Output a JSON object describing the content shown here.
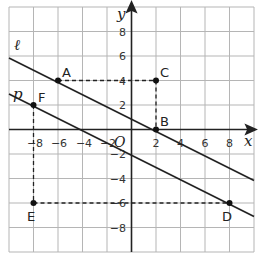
{
  "graph": {
    "x_axis_label": "x",
    "y_axis_label": "y",
    "origin_label": "O",
    "x_range": [
      -10,
      10
    ],
    "y_range": [
      -10,
      10
    ],
    "grid_step": 2,
    "x_ticks": [
      "−8",
      "−6",
      "−4",
      "−2",
      "2",
      "4",
      "6",
      "8"
    ],
    "y_ticks": [
      "8",
      "6",
      "4",
      "2",
      "−2",
      "−4",
      "−6",
      "−8"
    ],
    "lines": [
      {
        "name": "ℓ",
        "label": "ℓ",
        "equation": "y = -x/2 + 1",
        "through": [
          "A",
          "B"
        ]
      },
      {
        "name": "p",
        "label": "p",
        "equation": "y = -x/2 - 2",
        "through": [
          "F",
          "D"
        ]
      }
    ],
    "points": [
      {
        "label": "A",
        "x": -6,
        "y": 4
      },
      {
        "label": "B",
        "x": 2,
        "y": 0
      },
      {
        "label": "C",
        "x": 2,
        "y": 4
      },
      {
        "label": "D",
        "x": 8,
        "y": -6
      },
      {
        "label": "E",
        "x": -8,
        "y": -6
      },
      {
        "label": "F",
        "x": -8,
        "y": 2
      }
    ],
    "dashed_segments": [
      {
        "from": "A",
        "to": "C"
      },
      {
        "from": "C",
        "to": "B"
      },
      {
        "from": "F",
        "to": "E"
      },
      {
        "from": "E",
        "to": "D"
      }
    ]
  }
}
